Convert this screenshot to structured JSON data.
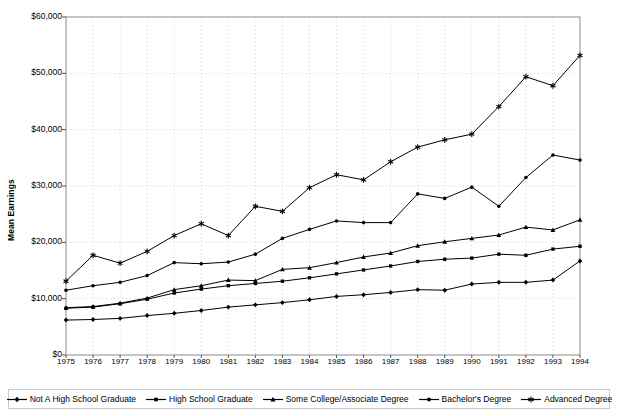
{
  "chart_data": {
    "type": "line",
    "title": "",
    "xlabel": "",
    "ylabel": "Mean Earnings",
    "xlim": [
      1975,
      1994
    ],
    "ylim": [
      0,
      60000
    ],
    "ytick_labels": [
      "$60,000",
      "$50,000",
      "$40,000",
      "$30,000",
      "$20,000",
      "$10,000",
      "$0"
    ],
    "ytick_values": [
      60000,
      50000,
      40000,
      30000,
      20000,
      10000,
      0
    ],
    "grid": true,
    "legend_position": "bottom",
    "x": [
      1975,
      1976,
      1977,
      1978,
      1979,
      1980,
      1981,
      1982,
      1983,
      1984,
      1985,
      1986,
      1987,
      1988,
      1989,
      1990,
      1991,
      1992,
      1993,
      1994
    ],
    "categories": [
      "1975",
      "1976",
      "1977",
      "1978",
      "1979",
      "1980",
      "1981",
      "1982",
      "1983",
      "1984",
      "1985",
      "1986",
      "1987",
      "1988",
      "1989",
      "1990",
      "1991",
      "1992",
      "1993",
      "1994"
    ],
    "series": [
      {
        "name": "Not A High School Graduate",
        "marker": "diamond",
        "values": [
          6200,
          6300,
          6500,
          7000,
          7400,
          7900,
          8500,
          8900,
          9300,
          9800,
          10400,
          10700,
          11100,
          11600,
          11500,
          12600,
          12900,
          12900,
          13300,
          16700
        ]
      },
      {
        "name": "High School Graduate",
        "marker": "square",
        "values": [
          8300,
          8500,
          9100,
          9900,
          11000,
          11700,
          12300,
          12700,
          13100,
          13700,
          14400,
          15100,
          15800,
          16600,
          17000,
          17200,
          17900,
          17700,
          18800,
          19300
        ]
      },
      {
        "name": "Some College/Associate Degree",
        "marker": "triangle",
        "values": [
          8400,
          8600,
          9200,
          10100,
          11600,
          12300,
          13300,
          13200,
          15200,
          15500,
          16400,
          17400,
          18100,
          19400,
          20100,
          20700,
          21300,
          22700,
          22200,
          24000
        ]
      },
      {
        "name": "Bachelor's Degree",
        "marker": "circle",
        "values": [
          11500,
          12300,
          12900,
          14100,
          16400,
          16200,
          16500,
          17900,
          20700,
          22300,
          23800,
          23500,
          23500,
          28600,
          27800,
          29800,
          26400,
          31500,
          35500,
          34600
        ]
      },
      {
        "name": "Advanced Degree",
        "marker": "asterisk",
        "values": [
          13100,
          17700,
          16300,
          18400,
          21200,
          23300,
          21200,
          26400,
          25500,
          29700,
          32000,
          31100,
          34300,
          36900,
          38200,
          39200,
          44100,
          49400,
          47800,
          53200
        ]
      }
    ]
  }
}
